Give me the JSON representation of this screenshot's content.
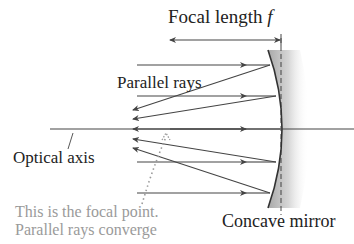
{
  "diagram": {
    "labels": {
      "focal_length": "Focal length ",
      "focal_symbol": "f",
      "parallel_rays": "Parallel rays",
      "optical_axis": "Optical axis",
      "concave_mirror": "Concave mirror",
      "note_line1": "This is the focal point.",
      "note_line2": "Parallel rays converge"
    },
    "colors": {
      "ray": "#444444",
      "mirror_edge": "#333333",
      "mirror_shade": "#bdbdbd",
      "note_text": "#9a9a9a",
      "text": "#222222"
    },
    "geometry": {
      "focal_point": {
        "x": 167,
        "y": 129
      },
      "mirror_vertex_x": 280,
      "ray_y": [
        65,
        96,
        129,
        162,
        193
      ],
      "focal_length_span": [
        167,
        280
      ]
    }
  }
}
